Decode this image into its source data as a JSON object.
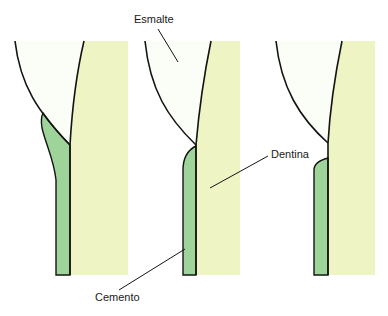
{
  "diagram": {
    "labels": {
      "enamel": "Esmalte",
      "dentin": "Dentina",
      "cementum": "Cemento"
    },
    "colors": {
      "enamel": "#fbfdf7",
      "dentin": "#eef4c4",
      "cementum": "#9ed49a",
      "outline": "#141414",
      "background": "#ffffff"
    },
    "panels": [
      {
        "id": "tooth-1",
        "description": "Cemento overlaps esmalte"
      },
      {
        "id": "tooth-2",
        "description": "Cemento meets esmalte edge-to-edge"
      },
      {
        "id": "tooth-3",
        "description": "Gap between cemento and esmalte exposes dentina"
      }
    ]
  }
}
